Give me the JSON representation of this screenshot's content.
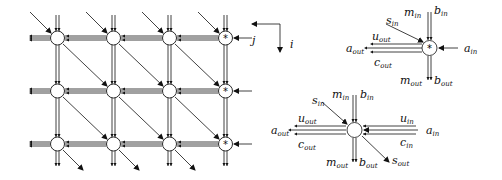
{
  "diagram": {
    "grid": {
      "rows": 3,
      "cols": 4,
      "col_x": [
        57,
        113,
        169,
        225
      ],
      "row_y": [
        38,
        91,
        144
      ],
      "boundary_marker": "*",
      "axis_labels": {
        "j": "j",
        "i": "i"
      }
    },
    "boundary_cell": {
      "marker": "*",
      "labels": {
        "m_in": "m",
        "m_in_sub": "in",
        "b_in": "b",
        "b_in_sub": "in",
        "s_in": "s",
        "s_in_sub": "in",
        "u_out": "u",
        "u_out_sub": "out",
        "a_out": "a",
        "a_out_sub": "out",
        "a_in": "a",
        "a_in_sub": "in",
        "c_out": "c",
        "c_out_sub": "out",
        "m_out": "m",
        "m_out_sub": "out",
        "b_out": "b",
        "b_out_sub": "out"
      }
    },
    "internal_cell": {
      "labels": {
        "m_in": "m",
        "m_in_sub": "in",
        "b_in": "b",
        "b_in_sub": "in",
        "s_in": "s",
        "s_in_sub": "in",
        "u_out": "u",
        "u_out_sub": "out",
        "u_in": "u",
        "u_in_sub": "in",
        "a_out": "a",
        "a_out_sub": "out",
        "a_in": "a",
        "a_in_sub": "in",
        "c_out": "c",
        "c_out_sub": "out",
        "c_in": "c",
        "c_in_sub": "in",
        "m_out": "m",
        "m_out_sub": "out",
        "b_out": "b",
        "b_out_sub": "out",
        "s_out": "s",
        "s_out_sub": "out"
      }
    },
    "colors": {
      "stroke": "#111111",
      "background": "#ffffff"
    }
  }
}
